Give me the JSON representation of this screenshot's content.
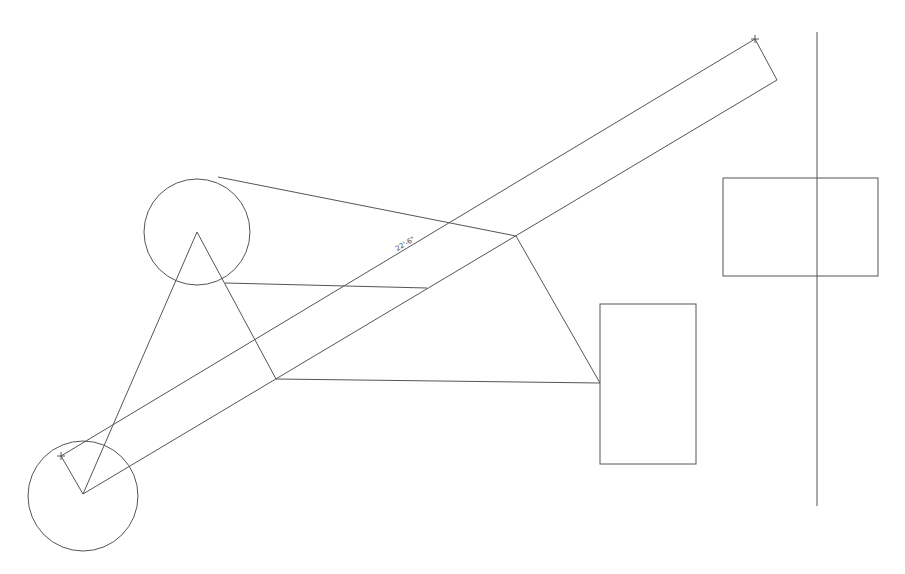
{
  "drawing": {
    "dimension_label": "22'-6\"",
    "stroke_color": "#555555",
    "background": "#ffffff",
    "bar": {
      "upper": [
        [
          61,
          456
        ],
        [
          755,
          39
        ]
      ],
      "lower": [
        [
          83,
          494
        ],
        [
          777,
          80
        ]
      ],
      "start_cap": [
        [
          61,
          456
        ],
        [
          83,
          494
        ]
      ],
      "end_cap": [
        [
          755,
          39
        ],
        [
          777,
          80
        ]
      ]
    },
    "circles": [
      {
        "name": "top-circle",
        "cx": 197,
        "cy": 232,
        "r": 53
      },
      {
        "name": "bottom-circle",
        "cx": 83,
        "cy": 496,
        "r": 55
      }
    ],
    "rectangles": [
      {
        "name": "middle-rect",
        "x": 600,
        "y": 304,
        "w": 96,
        "h": 160
      },
      {
        "name": "right-rect",
        "x": 723,
        "y": 178,
        "w": 155,
        "h": 98
      }
    ],
    "vertical_line": {
      "x": 817,
      "y1": 32,
      "y2": 506
    }
  }
}
